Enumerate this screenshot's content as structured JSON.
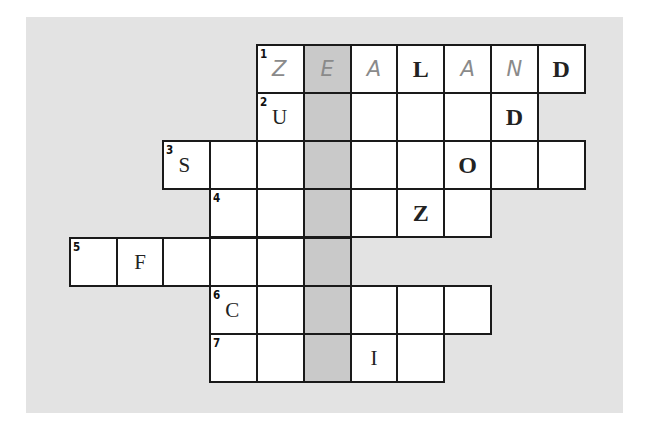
{
  "puzzle": {
    "type": "crossword",
    "colors": {
      "panel": "#e3e3e3",
      "cell": "#ffffff",
      "shaded": "#c9c9c9",
      "border": "#1a1a1a"
    },
    "grid": {
      "origin_x": 70,
      "origin_y": 45,
      "cell_w": 46.8,
      "cell_h": 48.2,
      "shaded_column": 5
    },
    "rows": [
      {
        "number": "1",
        "start_col": 4,
        "end_col": 10,
        "cells": [
          {
            "col": 4,
            "letter": "Z",
            "style": "light"
          },
          {
            "col": 5,
            "letter": "E",
            "style": "light"
          },
          {
            "col": 6,
            "letter": "A",
            "style": "light"
          },
          {
            "col": 7,
            "letter": "L",
            "style": "bold"
          },
          {
            "col": 8,
            "letter": "A",
            "style": "light"
          },
          {
            "col": 9,
            "letter": "N",
            "style": "light"
          },
          {
            "col": 10,
            "letter": "D",
            "style": "bold"
          }
        ]
      },
      {
        "number": "2",
        "start_col": 4,
        "end_col": 9,
        "cells": [
          {
            "col": 4,
            "letter": "U",
            "style": "normal"
          },
          {
            "col": 9,
            "letter": "D",
            "style": "bold"
          }
        ]
      },
      {
        "number": "3",
        "start_col": 2,
        "end_col": 10,
        "cells": [
          {
            "col": 2,
            "letter": "S",
            "style": "normal"
          },
          {
            "col": 8,
            "letter": "O",
            "style": "bold"
          }
        ]
      },
      {
        "number": "4",
        "start_col": 3,
        "end_col": 8,
        "cells": [
          {
            "col": 7,
            "letter": "Z",
            "style": "bold"
          }
        ]
      },
      {
        "number": "5",
        "start_col": 0,
        "end_col": 5,
        "cells": [
          {
            "col": 1,
            "letter": "F",
            "style": "normal"
          }
        ]
      },
      {
        "number": "6",
        "start_col": 3,
        "end_col": 8,
        "cells": [
          {
            "col": 3,
            "letter": "C",
            "style": "normal"
          }
        ]
      },
      {
        "number": "7",
        "start_col": 3,
        "end_col": 7,
        "cells": [
          {
            "col": 6,
            "letter": "I",
            "style": "normal"
          }
        ]
      }
    ]
  }
}
